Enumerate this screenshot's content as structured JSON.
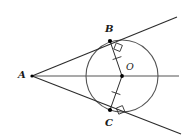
{
  "figure": {
    "width": 190,
    "height": 140,
    "background": "#ffffff"
  },
  "colors": {
    "stroke": "#2b2b2b",
    "secant_line": "#8c8c8c",
    "circle": "#555555",
    "point_fill": "#000000",
    "label": "#1a1a1a"
  },
  "labels": {
    "a": "A",
    "b": "B",
    "c": "C",
    "o": "O"
  },
  "points": {
    "A": {
      "x": 32,
      "y": 76,
      "label_x": 18,
      "label_y": 70
    },
    "B": {
      "x": 110,
      "y": 41,
      "label_x": 105,
      "label_y": 24
    },
    "C": {
      "x": 110,
      "y": 110,
      "label_x": 105,
      "label_y": 118
    },
    "O": {
      "x": 122,
      "y": 76,
      "label_x": 126,
      "label_y": 62
    }
  },
  "circle": {
    "cx": 122,
    "cy": 76,
    "r": 36
  },
  "lines": {
    "tangent_upper": {
      "x1": 32,
      "y1": 76,
      "x2": 177,
      "y2": 17
    },
    "tangent_lower": {
      "x1": 32,
      "y1": 76,
      "x2": 181,
      "y2": 134
    },
    "axis": {
      "x1": 32,
      "y1": 76,
      "x2": 179,
      "y2": 76
    },
    "radius_ob": {
      "x1": 110,
      "y1": 41,
      "x2": 122,
      "y2": 76
    },
    "radius_oc": {
      "x1": 122,
      "y1": 76,
      "x2": 110,
      "y2": 110
    }
  },
  "markers": {
    "right_angle_b": "right-angle-square",
    "right_angle_c": "right-angle-square",
    "tick_ob": "congruence-tick",
    "tick_oc": "congruence-tick"
  }
}
